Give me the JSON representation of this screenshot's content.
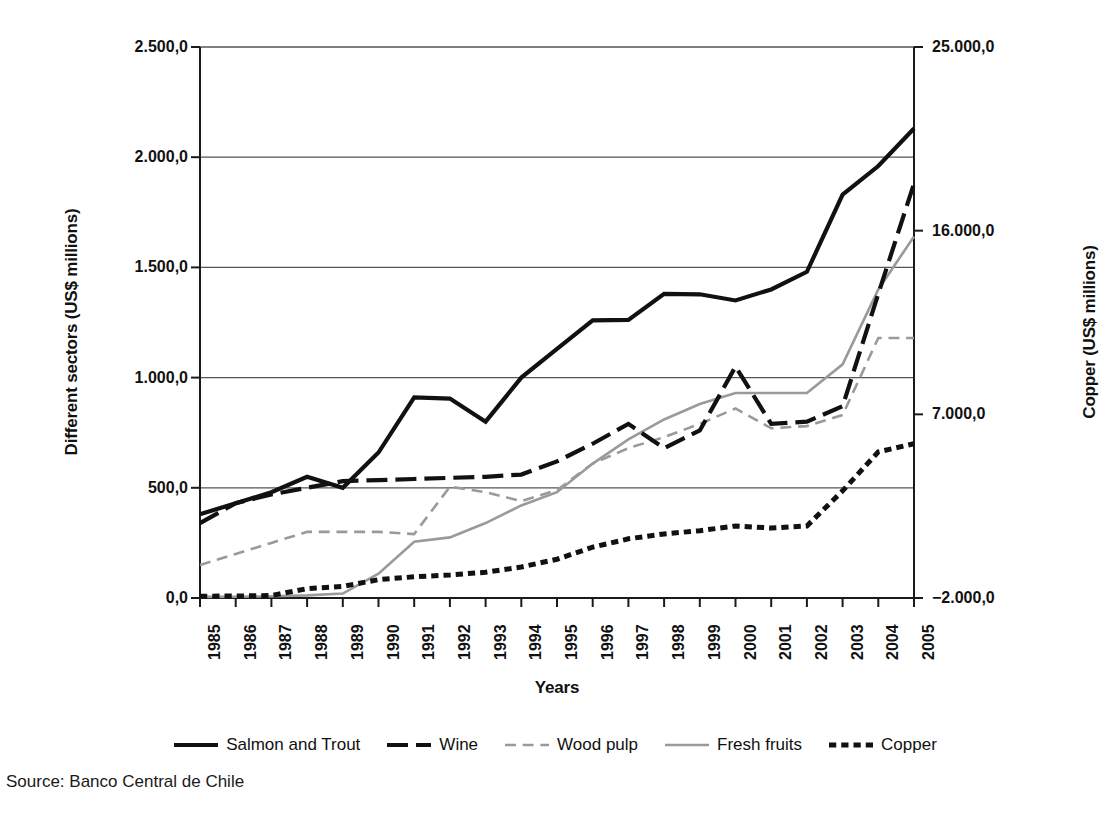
{
  "chart_data": {
    "type": "line",
    "title": "",
    "subtitle": "",
    "xlabel": "Years",
    "ylabel": "Different sectors (US$ millions)",
    "y2label": "Copper (US$ millions)",
    "grid": true,
    "legend_position": "bottom",
    "x": [
      1985,
      1986,
      1987,
      1988,
      1989,
      1990,
      1991,
      1992,
      1993,
      1994,
      1995,
      1996,
      1997,
      1998,
      1999,
      2000,
      2001,
      2002,
      2003,
      2004,
      2005
    ],
    "categories": [
      "1985",
      "1986",
      "1987",
      "1988",
      "1989",
      "1990",
      "1991",
      "1992",
      "1993",
      "1994",
      "1995",
      "1996",
      "1997",
      "1998",
      "1999",
      "2000",
      "2001",
      "2002",
      "2003",
      "2004",
      "2005"
    ],
    "ylim": [
      0,
      2500
    ],
    "yticks": [
      0,
      500,
      1000,
      1500,
      2000,
      2500
    ],
    "ytick_labels": [
      "0,0",
      "500,0",
      "1.000,0",
      "1.500,0",
      "2.000,0",
      "2.500,0"
    ],
    "y2lim": [
      -2000,
      25000
    ],
    "y2ticks": [
      -2000,
      7000,
      16000,
      25000
    ],
    "y2tick_labels": [
      "−2.000,0",
      "7.000,0",
      "16.000,0",
      "25.000,0"
    ],
    "series": [
      {
        "name": "Salmon and Trout",
        "axis": "left",
        "style": "solid",
        "color": "#111111",
        "width": 4.2,
        "values": [
          380,
          430,
          480,
          550,
          500,
          660,
          910,
          905,
          800,
          1000,
          1130,
          1260,
          1262,
          1380,
          1378,
          1350,
          1400,
          1480,
          1830,
          1960,
          2130
        ]
      },
      {
        "name": "Wine",
        "axis": "left",
        "style": "dashed",
        "color": "#111111",
        "width": 4.2,
        "values": [
          340,
          430,
          470,
          500,
          530,
          535,
          540,
          545,
          550,
          560,
          620,
          700,
          790,
          680,
          760,
          1050,
          790,
          800,
          870,
          1380,
          1880
        ]
      },
      {
        "name": "Wood pulp",
        "axis": "left",
        "style": "dashed",
        "color": "#9a9a9a",
        "width": 2.6,
        "values": [
          150,
          200,
          250,
          300,
          300,
          300,
          290,
          505,
          480,
          440,
          490,
          610,
          680,
          730,
          790,
          860,
          770,
          780,
          830,
          1180,
          1180
        ]
      },
      {
        "name": "Fresh fruits",
        "axis": "left",
        "style": "solid",
        "color": "#9a9a9a",
        "width": 2.6,
        "values": [
          5,
          6,
          8,
          12,
          20,
          110,
          255,
          275,
          340,
          420,
          480,
          610,
          720,
          810,
          880,
          930,
          930,
          930,
          1060,
          1400,
          1640
        ]
      },
      {
        "name": "Copper",
        "axis": "right",
        "style": "dotted",
        "color": "#111111",
        "width": 5.0,
        "values": [
          -1910,
          -1905,
          -1880,
          -1540,
          -1430,
          -1100,
          -960,
          -870,
          -740,
          -480,
          -100,
          490,
          900,
          1140,
          1300,
          1530,
          1430,
          1530,
          3250,
          5160,
          5560
        ],
        "values_left_axis_equivalent": [
          5,
          6,
          10,
          30,
          40,
          80,
          110,
          125,
          140,
          170,
          240,
          330,
          410,
          450,
          480,
          520,
          500,
          520,
          640,
          800,
          860
        ]
      }
    ],
    "annotations": [],
    "source": "Source: Banco Central de Chile"
  },
  "legend": {
    "items": [
      {
        "label": "Salmon and Trout",
        "style": "solid",
        "color": "#111111",
        "width": 4.2
      },
      {
        "label": "Wine",
        "style": "dashed",
        "color": "#111111",
        "width": 4.2
      },
      {
        "label": "Wood pulp",
        "style": "dashed",
        "color": "#9a9a9a",
        "width": 2.6
      },
      {
        "label": "Fresh fruits",
        "style": "solid",
        "color": "#9a9a9a",
        "width": 2.6
      },
      {
        "label": "Copper",
        "style": "dotted",
        "color": "#111111",
        "width": 5.0
      }
    ]
  },
  "footer": {
    "source": "Source: Banco Central de Chile"
  },
  "colors": {
    "axis": "#1a1a1a",
    "grid": "#555555",
    "dark_series": "#111111",
    "gray_series": "#9a9a9a",
    "background": "#ffffff"
  }
}
